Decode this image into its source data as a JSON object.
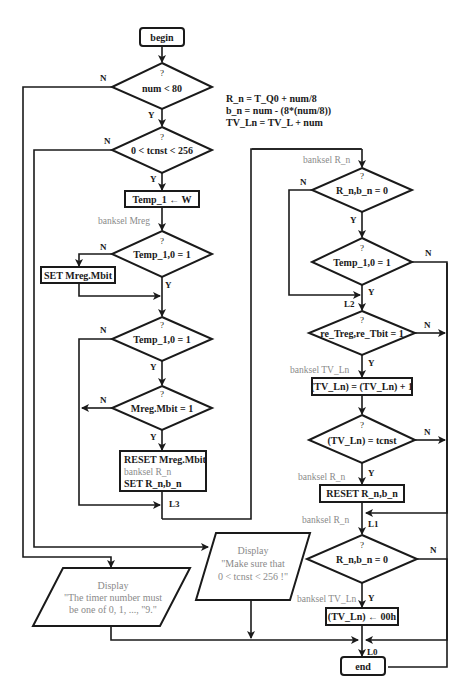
{
  "diagram": {
    "type": "flowchart",
    "start": "begin",
    "end": "end",
    "formulas": [
      "R_n = T_Q0 + num/8",
      "b_n = num - (8*(num/8))",
      "TV_Ln = TV_L + num"
    ],
    "decisions": {
      "d1": {
        "q": "?",
        "text": "num < 80",
        "yes": "Y",
        "no": "N"
      },
      "d2": {
        "q": "?",
        "text": "0 < tcnst < 256",
        "yes": "Y",
        "no": "N"
      },
      "d3": {
        "q": "?",
        "text": "Temp_1,0 = 1",
        "yes": "Y",
        "no": "N"
      },
      "d4": {
        "q": "?",
        "text": "Temp_1,0 = 1",
        "yes": "Y",
        "no": "N"
      },
      "d5": {
        "q": "?",
        "text": "Mreg.Mbit = 1",
        "yes": "Y",
        "no": "N"
      },
      "d6": {
        "q": "?",
        "text": "R_n,b_n = 0",
        "yes": "Y",
        "no": "N"
      },
      "d7": {
        "q": "?",
        "text": "Temp_1,0 = 1",
        "yes": "Y",
        "no": "N"
      },
      "d8": {
        "q": "?",
        "text": "re_Treg,re_Tbit = 1",
        "yes": "Y",
        "no": "N"
      },
      "d9": {
        "q": "?",
        "text": "(TV_Ln) = tcnst",
        "yes": "Y",
        "no": "N"
      },
      "d10": {
        "q": "?",
        "text": "R_n,b_n = 0",
        "yes": "Y",
        "no": "N"
      }
    },
    "processes": {
      "p1": "Temp_1 ← W",
      "p2": "SET Mreg.Mbit",
      "p3_line1": "RESET Mreg.Mbit",
      "p3_line2": "banksel R_n",
      "p3_line3": "SET  R_n,b_n",
      "p4": "(TV_Ln) = (TV_Ln) + 1",
      "p5": "RESET  R_n,b_n",
      "p6": "(TV_Ln) ← 00h"
    },
    "annotations": {
      "banksel_mreg": "banksel Mreg",
      "banksel_rn_top": "banksel R_n",
      "banksel_tvln_1": "banksel TV_Ln",
      "banksel_rn_2": "banksel R_n",
      "banksel_rn_3": "banksel R_n",
      "banksel_tvln_2": "banksel TV_Ln"
    },
    "labels": {
      "L0": "L0",
      "L1": "L1",
      "L2": "L2",
      "L3": "L3"
    },
    "displays": {
      "display1_title": "Display",
      "display1_line1": "\"Make sure that",
      "display1_line2": "0 < tcnst < 256 !\"",
      "display2_title": "Display",
      "display2_line1": "\"The timer number must",
      "display2_line2": "be one of 0, 1, ..., \"9.\""
    },
    "caption": "FIGURE 5.32   The flowchart of the macro 'STR_0'."
  }
}
